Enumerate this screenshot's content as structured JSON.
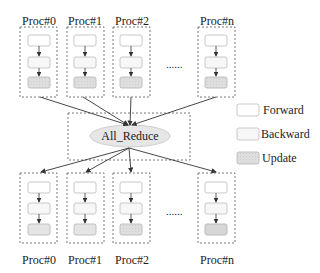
{
  "diagram": {
    "top_processes": [
      {
        "label": "Proc#0"
      },
      {
        "label": "Proc#1"
      },
      {
        "label": "Proc#2"
      },
      {
        "label": "Proc#n"
      }
    ],
    "bottom_processes": [
      {
        "label": "Proc#0"
      },
      {
        "label": "Proc#1"
      },
      {
        "label": "Proc#2"
      },
      {
        "label": "Proc#n"
      }
    ],
    "ellipsis": "......",
    "center_node": {
      "label": "All_Reduce"
    },
    "legend": [
      {
        "label": "Forward",
        "color": "#ffffff"
      },
      {
        "label": "Backward",
        "color": "#f7f7f7"
      },
      {
        "label": "Update",
        "color": "#dcdcdc"
      }
    ],
    "colors": {
      "ellipse_fill": "#e6e6e6",
      "block_border": "#c8c8c8",
      "dashed_border": "#555555",
      "arrow": "#333333"
    }
  }
}
